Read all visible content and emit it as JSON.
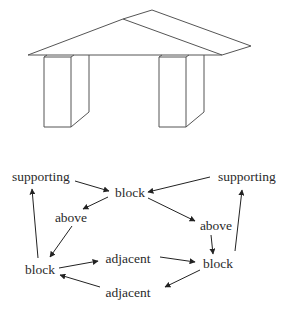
{
  "figure": {
    "drawing": {
      "description": "Line drawing of a roof/slab resting on two rectangular pillar blocks",
      "stroke_color": "#555555",
      "roof": {
        "front_triangle": [
          [
            28,
            55
          ],
          [
            123,
            19
          ],
          [
            222,
            55
          ]
        ],
        "back_plane": [
          [
            123,
            19
          ],
          [
            152,
            10
          ],
          [
            251,
            46
          ],
          [
            222,
            55
          ]
        ],
        "base_line": [
          [
            28,
            55
          ],
          [
            222,
            55
          ]
        ]
      },
      "pillars": [
        {
          "name": "left",
          "front": {
            "x1": 44,
            "x2": 71,
            "y1": 57,
            "y2": 127
          },
          "side_x": 89,
          "side_bottom_y": 112
        },
        {
          "name": "right",
          "front": {
            "x1": 159,
            "x2": 186,
            "y1": 57,
            "y2": 127
          },
          "side_x": 204,
          "side_bottom_y": 112
        }
      ]
    },
    "graph": {
      "nodes": [
        {
          "id": "supporting_l",
          "label": "supporting",
          "x": 41,
          "y": 177
        },
        {
          "id": "block_top",
          "label": "block",
          "x": 130,
          "y": 193
        },
        {
          "id": "supporting_r",
          "label": "supporting",
          "x": 247,
          "y": 177
        },
        {
          "id": "above_l",
          "label": "above",
          "x": 71,
          "y": 218
        },
        {
          "id": "above_r",
          "label": "above",
          "x": 216,
          "y": 226
        },
        {
          "id": "block_l",
          "label": "block",
          "x": 40,
          "y": 270
        },
        {
          "id": "adjacent_top",
          "label": "adjacent",
          "x": 128,
          "y": 259
        },
        {
          "id": "block_r",
          "label": "block",
          "x": 218,
          "y": 264
        },
        {
          "id": "adjacent_bottom",
          "label": "adjacent",
          "x": 128,
          "y": 293
        }
      ],
      "edges": [
        {
          "from": "supporting_l",
          "to": "block_top",
          "x1": 75,
          "y1": 181,
          "x2": 109,
          "y2": 191
        },
        {
          "from": "supporting_r",
          "to": "block_top",
          "x1": 210,
          "y1": 177,
          "x2": 148,
          "y2": 192
        },
        {
          "from": "block_top",
          "to": "above_l",
          "x1": 108,
          "y1": 197,
          "x2": 83,
          "y2": 209
        },
        {
          "from": "block_top",
          "to": "above_r",
          "x1": 148,
          "y1": 198,
          "x2": 195,
          "y2": 221
        },
        {
          "from": "above_l",
          "to": "block_l",
          "x1": 72,
          "y1": 226,
          "x2": 50,
          "y2": 257
        },
        {
          "from": "above_r",
          "to": "block_r",
          "x1": 211,
          "y1": 235,
          "x2": 213,
          "y2": 254
        },
        {
          "from": "block_l",
          "to": "supporting_l",
          "x1": 38,
          "y1": 258,
          "x2": 32,
          "y2": 189
        },
        {
          "from": "block_r",
          "to": "supporting_r",
          "x1": 235,
          "y1": 251,
          "x2": 242,
          "y2": 190
        },
        {
          "from": "block_l",
          "to": "adjacent_top",
          "x1": 59,
          "y1": 268,
          "x2": 98,
          "y2": 261
        },
        {
          "from": "adjacent_top",
          "to": "block_r",
          "x1": 160,
          "y1": 257,
          "x2": 195,
          "y2": 262
        },
        {
          "from": "block_r",
          "to": "adjacent_bottom",
          "x1": 200,
          "y1": 270,
          "x2": 165,
          "y2": 287
        },
        {
          "from": "adjacent_bottom",
          "to": "block_l",
          "x1": 100,
          "y1": 287,
          "x2": 60,
          "y2": 275
        }
      ],
      "arrow_color": "#222222"
    },
    "caption": {
      "text": "",
      "note": "caption line clipped at bottom edge; only tops of glyphs visible"
    }
  }
}
